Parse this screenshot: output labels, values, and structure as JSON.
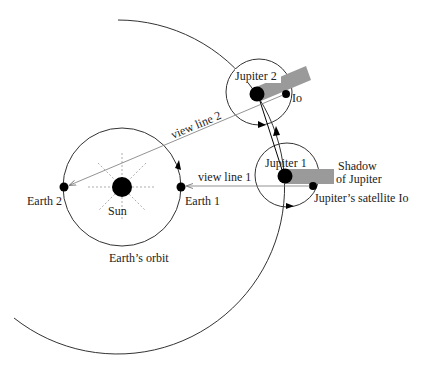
{
  "diagram": {
    "labels": {
      "sun": "Sun",
      "earth1": "Earth 1",
      "earth2": "Earth 2",
      "earth_orbit": "Earth’s orbit",
      "jupiter1": "Jupiter 1",
      "jupiter2": "Jupiter 2",
      "io2": "Io",
      "io1": "Jupiter’s satellite Io",
      "shadow_line1": "Shadow",
      "shadow_line2": "of Jupiter",
      "view_line1": "view line 1",
      "view_line2": "view line 2"
    },
    "colors": {
      "ink": "#000000",
      "orbit": "#333333",
      "shadow": "#9a9a9a",
      "view_line": "#777777",
      "sun_rays": "#999999"
    }
  }
}
